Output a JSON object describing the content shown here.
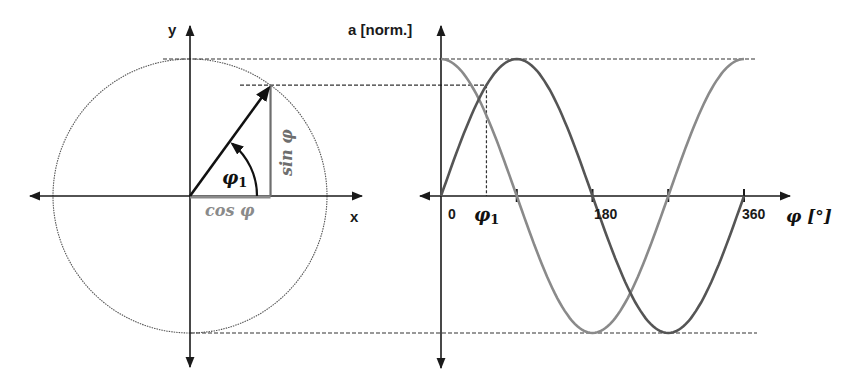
{
  "diagram": {
    "phi1_deg": 54,
    "colors": {
      "axis": "#1a1a1a",
      "vector": "#111111",
      "sin_curve": "#555555",
      "cos_curve": "#8a8a8a",
      "sin_label": "#6e6e6e",
      "cos_label": "#8a8a8a",
      "dashed": "#333333",
      "circle": "#555555"
    },
    "left": {
      "y_axis_label": "y",
      "x_axis_label": "x",
      "angle_label": "φ",
      "angle_subscript": "1",
      "sin_label": "sin φ",
      "cos_label": "cos φ"
    },
    "right": {
      "y_axis_label": "a [norm.]",
      "x_axis_label": "φ [°]",
      "tick_labels": [
        "0",
        "180",
        "360"
      ],
      "phi_label": "φ",
      "phi_subscript": "1"
    }
  },
  "chart_data": {
    "type": "line",
    "title": "",
    "xlabel": "φ [°]",
    "ylabel": "a [norm.]",
    "x_range": [
      0,
      360
    ],
    "y_range": [
      -1,
      1
    ],
    "x_ticks": [
      0,
      90,
      180,
      270,
      360
    ],
    "x_tick_labels": [
      "0",
      "",
      "180",
      "",
      "360"
    ],
    "series": [
      {
        "name": "sin φ",
        "function": "sin",
        "x": [
          0,
          90,
          180,
          270,
          360
        ],
        "values": [
          0,
          1,
          0,
          -1,
          0
        ]
      },
      {
        "name": "cos φ",
        "function": "cos",
        "x": [
          0,
          90,
          180,
          270,
          360
        ],
        "values": [
          1,
          0,
          -1,
          0,
          1
        ]
      }
    ],
    "annotations": [
      {
        "label": "φ1",
        "x": 54,
        "y": 0.81
      }
    ]
  }
}
